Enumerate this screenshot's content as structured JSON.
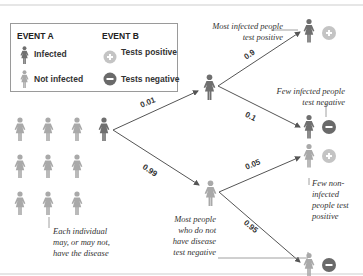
{
  "legend": {
    "event_a_title": "EVENT A",
    "event_b_title": "EVENT B",
    "infected_label": "Infected",
    "not_infected_label": "Not infected",
    "tests_positive_label": "Tests positive",
    "tests_negative_label": "Tests negative",
    "icons": {
      "infected": "person-dark-icon",
      "not_infected": "person-light-icon",
      "positive": "plus-circle-icon",
      "negative": "minus-circle-icon"
    }
  },
  "colors": {
    "infected": "#6f6f6f",
    "not_infected": "#a9a9a9",
    "positive": "#c4c4c4",
    "negative": "#6a6a6a",
    "line": "#555555",
    "border": "#9a9a9a"
  },
  "tree": {
    "p_infected": "0.01",
    "p_not_infected": "0.99",
    "p_infected_positive": "0.9",
    "p_infected_negative": "0.1",
    "p_not_infected_positive": "0.05",
    "p_not_infected_negative": "0.95"
  },
  "annotations": {
    "most_infected_1": "Most infected people",
    "most_infected_2": "test positive",
    "few_infected_1": "Few infected people",
    "few_infected_2": "test negative",
    "few_non_1": "Few non-",
    "few_non_2": "infected",
    "few_non_3": "people test",
    "few_non_4": "positive",
    "most_people_1": "Most people",
    "most_people_2": "who do not",
    "most_people_3": "have disease",
    "most_people_4": "test negative",
    "each_1": "Each individual",
    "each_2": "may, or may not,",
    "each_3": "have the disease"
  }
}
